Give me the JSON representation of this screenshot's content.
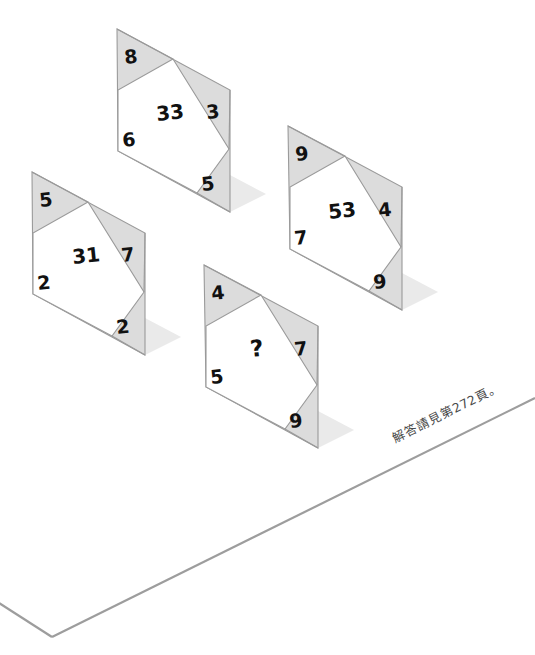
{
  "page": {
    "background_color": "#ffffff"
  },
  "style": {
    "panel_fill": "#dcdcdc",
    "panel_fill_light": "#e3e3e3",
    "panel_stroke": "#9a9a9a",
    "inner_fill": "#ffffff",
    "shadow_fill": "#eaeaea",
    "number_color": "#111111",
    "ground_stroke": "#9d9d9d",
    "caption_color": "#4a4a4a"
  },
  "puzzle": {
    "type": "number-logic-puzzle",
    "panel_count": 4,
    "rule_hint": "each panel has four corner numbers and one centre number",
    "panels": [
      {
        "id": "panel-33",
        "name": "top-panel",
        "corners": {
          "top_left": "8",
          "top_right": "3",
          "bottom_left": "6",
          "bottom_right": "5"
        },
        "center": "33",
        "is_question": false
      },
      {
        "id": "panel-31",
        "name": "left-panel",
        "corners": {
          "top_left": "5",
          "top_right": "7",
          "bottom_left": "2",
          "bottom_right": "2"
        },
        "center": "31",
        "is_question": false
      },
      {
        "id": "panel-53",
        "name": "right-panel",
        "corners": {
          "top_left": "9",
          "top_right": "4",
          "bottom_left": "7",
          "bottom_right": "9"
        },
        "center": "53",
        "is_question": false
      },
      {
        "id": "panel-question",
        "name": "bottom-panel",
        "corners": {
          "top_left": "4",
          "top_right": "7",
          "bottom_left": "5",
          "bottom_right": "9"
        },
        "center": "?",
        "is_question": true
      }
    ]
  },
  "caption": {
    "text": "解答請見第272頁。",
    "page_number": "272"
  }
}
